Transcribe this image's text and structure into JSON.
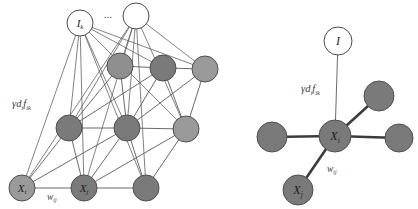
{
  "figure": {
    "background": "#ffffff"
  },
  "colors": {
    "edge": "#5a5a5a",
    "edge_thick": "#3c3c3c",
    "node_dark": "#7a7a7a",
    "node_dark_stroke": "#4f4f4f",
    "node_light": "#9a9a9a",
    "node_light_stroke": "#5a5a5a",
    "node_white": "#ffffff",
    "node_white_stroke": "#4a4a4a",
    "label": "#3a3a3a"
  },
  "left_panel": {
    "name": "full-network-panel",
    "ellipsis": "...",
    "labels": {
      "gamma_term": {
        "gamma": "γ",
        "d": "d",
        "d_sub": "i",
        "f": "f",
        "f_sub": "ik"
      },
      "weight_term": {
        "w": "w",
        "w_sub": "ij"
      }
    },
    "nodes": [
      {
        "id": "Ik",
        "label": "I",
        "sub": "k",
        "kind": "input",
        "fill": "#ffffff",
        "cx": 80,
        "cy": 23,
        "r": 13
      },
      {
        "id": "Iu",
        "label": "",
        "sub": "",
        "kind": "input",
        "fill": "#ffffff",
        "cx": 136,
        "cy": 16,
        "r": 13
      },
      {
        "id": "h1",
        "label": "",
        "sub": "",
        "kind": "hidden",
        "fill": "#8f8f8f",
        "cx": 120,
        "cy": 66,
        "r": 13
      },
      {
        "id": "h2",
        "label": "",
        "sub": "",
        "kind": "hidden",
        "fill": "#7a7a7a",
        "cx": 163,
        "cy": 68,
        "r": 13
      },
      {
        "id": "h3",
        "label": "",
        "sub": "",
        "kind": "hidden",
        "fill": "#9a9a9a",
        "cx": 205,
        "cy": 69,
        "r": 13
      },
      {
        "id": "m1",
        "label": "",
        "sub": "",
        "kind": "hidden",
        "fill": "#7a7a7a",
        "cx": 69,
        "cy": 128,
        "r": 13
      },
      {
        "id": "m2",
        "label": "",
        "sub": "",
        "kind": "hidden",
        "fill": "#7a7a7a",
        "cx": 127,
        "cy": 128,
        "r": 13
      },
      {
        "id": "m3",
        "label": "",
        "sub": "",
        "kind": "hidden",
        "fill": "#9a9a9a",
        "cx": 186,
        "cy": 129,
        "r": 13
      },
      {
        "id": "Xi",
        "label": "X",
        "sub": "i",
        "kind": "unit",
        "fill": "#9a9a9a",
        "cx": 22,
        "cy": 188,
        "r": 13
      },
      {
        "id": "Xj",
        "label": "X",
        "sub": "j",
        "kind": "unit",
        "fill": "#7a7a7a",
        "cx": 84,
        "cy": 188,
        "r": 13
      },
      {
        "id": "Xk",
        "label": "",
        "sub": "",
        "kind": "unit",
        "fill": "#7a7a7a",
        "cx": 146,
        "cy": 188,
        "r": 13
      }
    ],
    "lattice_edges": [
      [
        "h1",
        "h2"
      ],
      [
        "h2",
        "h3"
      ],
      [
        "m1",
        "m2"
      ],
      [
        "m2",
        "m3"
      ],
      [
        "Xi",
        "Xj"
      ],
      [
        "Xj",
        "Xk"
      ],
      [
        "h1",
        "m2"
      ],
      [
        "h2",
        "m3"
      ],
      [
        "m1",
        "Xj"
      ],
      [
        "m2",
        "Xk"
      ],
      [
        "h1",
        "m1"
      ],
      [
        "h2",
        "m2"
      ],
      [
        "h3",
        "m3"
      ],
      [
        "m1",
        "Xi"
      ],
      [
        "m2",
        "Xj"
      ],
      [
        "m3",
        "Xk"
      ],
      [
        "h3",
        "m2"
      ],
      [
        "m3",
        "Xj"
      ],
      [
        "h2",
        "m1"
      ],
      [
        "m2",
        "Xi"
      ]
    ],
    "input_edges": [
      [
        "Ik",
        "Xi"
      ],
      [
        "Ik",
        "Xj"
      ],
      [
        "Ik",
        "Xk"
      ],
      [
        "Ik",
        "m1"
      ],
      [
        "Ik",
        "m2"
      ],
      [
        "Ik",
        "m3"
      ],
      [
        "Ik",
        "h2"
      ],
      [
        "Ik",
        "h3"
      ],
      [
        "Iu",
        "Xi"
      ],
      [
        "Iu",
        "Xj"
      ],
      [
        "Iu",
        "Xk"
      ],
      [
        "Iu",
        "m1"
      ],
      [
        "Iu",
        "m2"
      ],
      [
        "Iu",
        "m3"
      ],
      [
        "Iu",
        "h1"
      ],
      [
        "Iu",
        "h3"
      ]
    ]
  },
  "right_panel": {
    "name": "local-star-panel",
    "labels": {
      "gamma_term": {
        "gamma": "γ",
        "d": "d",
        "d_sub": "i",
        "f": "f",
        "f_sub": "ik"
      },
      "weight_term": {
        "w": "w",
        "w_sub": "ij"
      }
    },
    "nodes": [
      {
        "id": "I",
        "label": "I",
        "sub": "",
        "kind": "input",
        "fill": "#ffffff",
        "cx": 338,
        "cy": 41,
        "r": 14
      },
      {
        "id": "center",
        "label": "X",
        "sub": "i",
        "kind": "center",
        "fill": "#7a7a7a",
        "cx": 335,
        "cy": 136,
        "r": 16
      },
      {
        "id": "nUR",
        "label": "",
        "sub": "",
        "kind": "neighbor",
        "fill": "#7a7a7a",
        "cx": 379,
        "cy": 96,
        "r": 15
      },
      {
        "id": "nL",
        "label": "",
        "sub": "",
        "kind": "neighbor",
        "fill": "#7a7a7a",
        "cx": 272,
        "cy": 137,
        "r": 15
      },
      {
        "id": "nR",
        "label": "",
        "sub": "",
        "kind": "neighbor",
        "fill": "#7a7a7a",
        "cx": 399,
        "cy": 138,
        "r": 14
      },
      {
        "id": "Xj",
        "label": "X",
        "sub": "j",
        "kind": "neighbor",
        "fill": "#7a7a7a",
        "cx": 298,
        "cy": 190,
        "r": 15
      }
    ],
    "edges": [
      {
        "from": "I",
        "to": "center",
        "style": "thin",
        "name": "input-edge"
      },
      {
        "from": "center",
        "to": "nUR",
        "style": "thick",
        "name": "lateral-edge"
      },
      {
        "from": "center",
        "to": "nL",
        "style": "thick",
        "name": "lateral-edge"
      },
      {
        "from": "center",
        "to": "nR",
        "style": "thick",
        "name": "lateral-edge"
      },
      {
        "from": "center",
        "to": "Xj",
        "style": "thick",
        "name": "weight-edge"
      }
    ]
  }
}
